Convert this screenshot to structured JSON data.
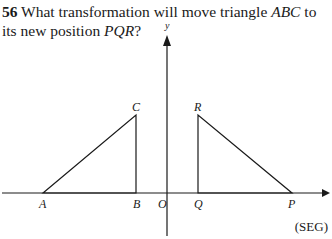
{
  "question": {
    "number": "56",
    "text_part1": " What transformation will move triangle ",
    "triangle1": "ABC",
    "text_part2": " to its new position ",
    "triangle2": "PQR",
    "text_part3": "?"
  },
  "axes": {
    "y_label": "y",
    "origin_label": "O"
  },
  "points": {
    "A": "A",
    "B": "B",
    "C": "C",
    "P": "P",
    "Q": "Q",
    "R": "R"
  },
  "source": "(SEG)"
}
